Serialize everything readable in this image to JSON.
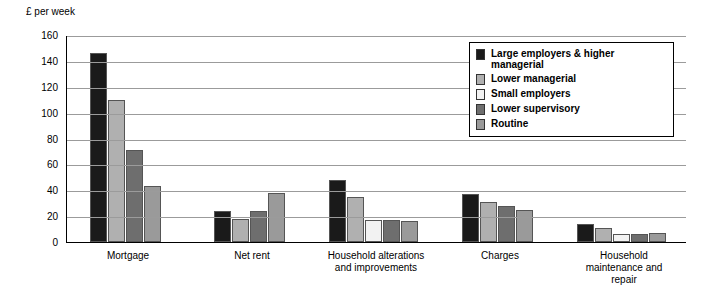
{
  "chart_data": {
    "type": "bar",
    "title": "",
    "ylabel": "£ per week",
    "xlabel": "",
    "ylim": [
      0,
      160
    ],
    "yticks": [
      0,
      20,
      40,
      60,
      80,
      100,
      120,
      140,
      160
    ],
    "grid": true,
    "legend_position": "top-right-inside",
    "categories": [
      "Mortgage",
      "Net rent",
      "Household alterations and improvements",
      "Charges",
      "Household maintenance and repair"
    ],
    "series": [
      {
        "name": "Large employers & higher managerial",
        "color": "#1a1a1a",
        "values": [
          146,
          24,
          48,
          37,
          14
        ]
      },
      {
        "name": "Lower managerial",
        "color": "#b0b0b0",
        "values": [
          110,
          18,
          35,
          31,
          11
        ]
      },
      {
        "name": "Small employers",
        "color": "#f2f2f2",
        "values": [
          0,
          0,
          17,
          0,
          6
        ]
      },
      {
        "name": "Lower supervisory",
        "color": "#6e6e6e",
        "values": [
          71,
          24,
          17,
          28,
          6
        ]
      },
      {
        "name": "Routine",
        "color": "#9a9a9a",
        "values": [
          43,
          38,
          16,
          25,
          7
        ]
      }
    ]
  },
  "category_labels": [
    [
      "Mortgage"
    ],
    [
      "Net rent"
    ],
    [
      "Household alterations",
      "and improvements"
    ],
    [
      "Charges"
    ],
    [
      "Household",
      "maintenance and",
      "repair"
    ]
  ],
  "legend": {
    "items": [
      {
        "label": "Large employers & higher managerial",
        "color": "#1a1a1a"
      },
      {
        "label": "Lower managerial",
        "color": "#b0b0b0"
      },
      {
        "label": "Small employers",
        "color": "#f2f2f2"
      },
      {
        "label": "Lower supervisory",
        "color": "#6e6e6e"
      },
      {
        "label": "Routine",
        "color": "#9a9a9a"
      }
    ]
  }
}
